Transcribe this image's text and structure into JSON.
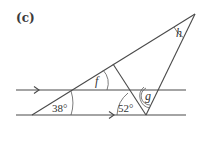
{
  "part_label": "(c)",
  "angles": {
    "given_1": "38°",
    "given_2": "52°",
    "unknown_f": "f",
    "unknown_g": "g",
    "unknown_h": "h"
  },
  "parallel_marks": {
    "upper_line": "single-arrow",
    "lower_line": "single-arrow"
  },
  "colors": {
    "stroke": "#4a4a4a",
    "text": "#333333",
    "background": "#ffffff"
  }
}
